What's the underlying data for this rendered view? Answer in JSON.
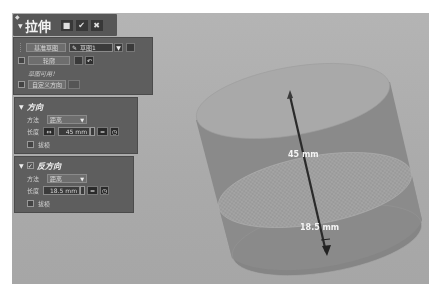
{
  "dialog": {
    "title": "拉伸",
    "header_buttons": {
      "pin_icon": "pin-icon",
      "lock_icon": "lock-icon",
      "ok_icon": "check-icon",
      "cancel_icon": "close-icon",
      "lock_glyph": "■",
      "ok_glyph": "✔",
      "cancel_glyph": "✖"
    },
    "section_profile": {
      "reference_sketch_label": "基准草图",
      "sketch_selector_value": "草图1",
      "profile_label": "轮廓",
      "status_text": "草图可用！",
      "custom_direction_label": "自定义方向"
    },
    "section_direction": {
      "title": "方向",
      "method_label": "方法",
      "method_value": "距离",
      "length_label": "长度",
      "length_value": "45 mm",
      "draft_label": "拔模",
      "draft_checked": false
    },
    "section_reverse": {
      "title": "反方向",
      "enabled": true,
      "method_label": "方法",
      "method_value": "距离",
      "length_label": "长度",
      "length_value": "18.5 mm",
      "draft_label": "拔模",
      "draft_checked": false
    }
  },
  "viewport": {
    "dimension_forward": "45 mm",
    "dimension_reverse": "18.5 mm"
  }
}
